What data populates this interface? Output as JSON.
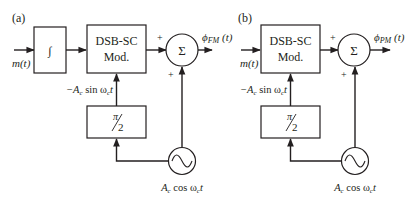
{
  "diagram": {
    "panel_a": {
      "label": "(a)",
      "input": "m(t)",
      "integrator": "∫",
      "modulator": [
        "DSB-SC",
        "Mod."
      ],
      "phase_shift": {
        "num": "π",
        "den": "2"
      },
      "carrier_to_mod": "−A",
      "carrier_to_mod_sub": "c",
      "carrier_to_mod_rest": " sin ω",
      "carrier_to_mod_sub2": "c",
      "carrier_to_mod_t": "t",
      "sum_symbol": "Σ",
      "plus_top": "+",
      "plus_bottom": "+",
      "output_phi": "ϕ",
      "output_sub": "FM",
      "output_arg": " (t)",
      "oscillator_A": "A",
      "oscillator_sub": "c",
      "oscillator_rest": " cos ω",
      "oscillator_sub2": "c",
      "oscillator_t": "t"
    },
    "panel_b": {
      "label": "(b)",
      "input": "m(t)",
      "modulator": [
        "DSB-SC",
        "Mod."
      ],
      "phase_shift": {
        "num": "π",
        "den": "2"
      },
      "carrier_to_mod": "−A",
      "carrier_to_mod_sub": "c",
      "carrier_to_mod_rest": " sin ω",
      "carrier_to_mod_sub2": "c",
      "carrier_to_mod_t": "t",
      "sum_symbol": "Σ",
      "plus_top": "+",
      "plus_bottom": "+",
      "output_phi": "ϕ",
      "output_sub": "PM",
      "output_arg": " (t)",
      "oscillator_A": "A",
      "oscillator_sub": "c",
      "oscillator_rest": " cos ω",
      "oscillator_sub2": "c",
      "oscillator_t": "t"
    }
  }
}
